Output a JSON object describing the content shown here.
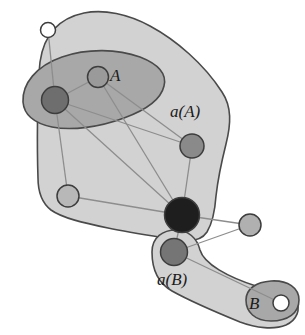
{
  "figure": {
    "background": "#ffffff",
    "width": 305,
    "height": 335
  },
  "colors": {
    "region_outer_fill": "#d2d2d2",
    "region_outer_stroke": "#4a4a4a",
    "region_inner_fill": "#a8a8a8",
    "region_inner_stroke": "#4a4a4a",
    "node_white": "#ffffff",
    "node_light": "#b8b8b8",
    "node_medium": "#9a9a9a",
    "node_dark": "#6e6e6e",
    "node_black": "#1e1e1e",
    "node_stroke": "#3d3d3d",
    "edge": "#8d8d8d",
    "label_text": "#1b1b1b"
  },
  "labels": {
    "set_a": "A",
    "closure_a": "a(A)",
    "set_b": "B",
    "closure_b": "a(B)"
  },
  "regions": [
    {
      "id": "closure-a",
      "name": "a(A)",
      "kind": "outer-blob",
      "label": "a(A)",
      "label_x": 188,
      "label_y": 113
    },
    {
      "id": "set-a",
      "name": "A",
      "kind": "inner-ellipse",
      "label": "A",
      "label_x": 118,
      "label_y": 79
    },
    {
      "id": "closure-b",
      "name": "a(B)",
      "kind": "outer-blob",
      "label": "a(B)",
      "label_x": 162,
      "label_y": 280
    },
    {
      "id": "set-b",
      "name": "B",
      "kind": "inner-capsule",
      "label": "B",
      "label_x": 255,
      "label_y": 309
    }
  ],
  "nodes": [
    {
      "id": "n1",
      "name": "node-top-left-white",
      "cx": 48,
      "cy": 30,
      "r": 7.5,
      "fill": "#ffffff",
      "region": "a(A)"
    },
    {
      "id": "n2",
      "name": "node-a-dark",
      "cx": 55,
      "cy": 100,
      "r": 13.5,
      "fill": "#6e6e6e",
      "region": "A"
    },
    {
      "id": "n3",
      "name": "node-a-light",
      "cx": 98,
      "cy": 77,
      "r": 10.5,
      "fill": "#9a9a9a",
      "region": "A"
    },
    {
      "id": "n4",
      "name": "node-mid-right-medium",
      "cx": 192,
      "cy": 146,
      "r": 12.0,
      "fill": "#8a8a8a",
      "region": "a(A)"
    },
    {
      "id": "n5",
      "name": "node-bottom-left-light",
      "cx": 68,
      "cy": 196,
      "r": 11.0,
      "fill": "#b8b8b8",
      "region": "a(A)"
    },
    {
      "id": "n6",
      "name": "node-center-black",
      "cx": 182,
      "cy": 215,
      "r": 17.5,
      "fill": "#1e1e1e",
      "region": "a(A)"
    },
    {
      "id": "n7",
      "name": "node-right-isolated",
      "cx": 250,
      "cy": 225,
      "r": 11.0,
      "fill": "#b0b0b0",
      "region": "none"
    },
    {
      "id": "n8",
      "name": "node-b-closure-dark",
      "cx": 174,
      "cy": 252,
      "r": 13.5,
      "fill": "#757575",
      "region": "a(B)"
    },
    {
      "id": "n9",
      "name": "node-b-white",
      "cx": 281,
      "cy": 303,
      "r": 8.0,
      "fill": "#ffffff",
      "region": "B"
    }
  ],
  "edges": [
    {
      "name": "edge-n1-n2",
      "from": "n1",
      "to": "n2"
    },
    {
      "name": "edge-n2-n5",
      "from": "n2",
      "to": "n5"
    },
    {
      "name": "edge-n2-n3",
      "from": "n2",
      "to": "n3"
    },
    {
      "name": "edge-n2-n4",
      "from": "n2",
      "to": "n4"
    },
    {
      "name": "edge-n2-n6",
      "from": "n2",
      "to": "n6"
    },
    {
      "name": "edge-n3-n4",
      "from": "n3",
      "to": "n4"
    },
    {
      "name": "edge-n3-n6",
      "from": "n3",
      "to": "n6"
    },
    {
      "name": "edge-n4-n6",
      "from": "n4",
      "to": "n6"
    },
    {
      "name": "edge-n5-n6",
      "from": "n5",
      "to": "n6"
    },
    {
      "name": "edge-n6-n7",
      "from": "n6",
      "to": "n7"
    },
    {
      "name": "edge-n6-n8",
      "from": "n6",
      "to": "n8"
    },
    {
      "name": "edge-n7-n8",
      "from": "n7",
      "to": "n8"
    },
    {
      "name": "edge-n8-n9",
      "from": "n8",
      "to": "n9"
    }
  ],
  "paths": {
    "closure_a": "M 40 62 C 44 34 60 18 84 13 C 104 9 128 14 150 26 C 176 40 204 64 222 92 C 232 107 231 124 226 144 C 222 160 218 178 216 196 C 215 210 213 222 207 232 C 201 241 190 242 178 240 C 160 237 132 233 108 228 C 84 223 62 218 51 210 C 42 203 38 192 38 178 C 37 150 37 92 40 62 Z",
    "set_a": "M 23 102 C 22 84 36 66 62 57 C 88 48 118 49 140 57 C 158 64 167 74 164 86 C 161 99 146 110 124 118 C 100 127 72 131 52 127 C 33 123 24 114 23 102 Z",
    "closure_b": "M 152 252 C 152 237 163 230 176 230 C 188 230 197 238 200 250 C 204 264 228 277 256 286 C 276 292 291 293 296 301 C 301 309 297 320 286 325 C 274 330 256 328 240 322 C 218 313 190 301 172 291 C 158 283 152 270 152 252 Z",
    "set_b": "M 246 300 C 246 289 256 282 271 281 C 288 280 299 288 299 300 C 299 313 288 321 271 321 C 255 321 246 312 246 300 Z"
  }
}
